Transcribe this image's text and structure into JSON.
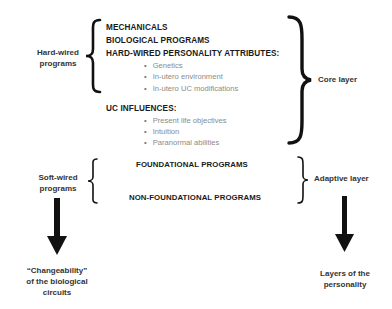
{
  "left_labels": {
    "hard_wired": "Hard-wired\nprograms",
    "hard_wired_line1": "Hard-wired",
    "hard_wired_line2": "programs",
    "soft_wired_line1": "Soft-wired",
    "soft_wired_line2": "programs",
    "changeability_line1": "“Changeability”",
    "changeability_line2": "of the biological",
    "changeability_line3": "circuits"
  },
  "core": {
    "items": [
      {
        "title": "MECHANICALS"
      },
      {
        "title": "BIOLOGICAL PROGRAMS"
      },
      {
        "title": "HARD-WIRED PERSONALITY ATTRIBUTES:",
        "bullets": [
          "Genetics",
          "In-utero environment",
          "In-utero UC modifications"
        ]
      },
      {
        "title": "UC INFLUENCES:",
        "bullets": [
          "Present life objectives",
          "Intuition",
          "Paranormal abilities"
        ]
      }
    ]
  },
  "adaptive": {
    "items": [
      "FOUNDATIONAL PROGRAMS",
      "NON-FOUNDATIONAL PROGRAMS"
    ]
  },
  "right_labels": {
    "core_layer": "Core layer",
    "adaptive_layer": "Adaptive layer",
    "layers_line1": "Layers of the",
    "layers_line2": "personality"
  }
}
